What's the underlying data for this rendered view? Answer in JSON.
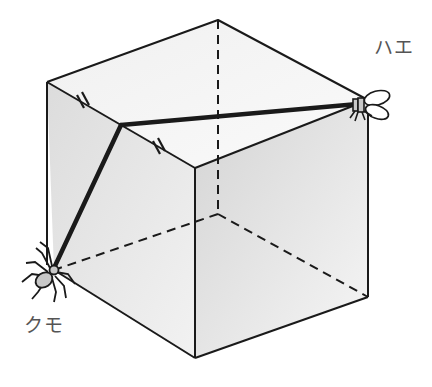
{
  "diagram": {
    "type": "cube-shortest-path",
    "labels": {
      "fly": "ハエ",
      "spider": "クモ"
    },
    "colors": {
      "edge": "#1a1a1a",
      "path": "#1a1a1a",
      "face_top": "#f4f4f4",
      "face_left": "#e2e2e2",
      "face_right": "#ebebeb",
      "creature_fill": "#c8c8c8",
      "label": "#555555"
    },
    "annotations": {
      "equal_segments_mark": "//"
    }
  }
}
